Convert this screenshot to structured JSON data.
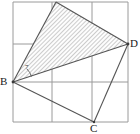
{
  "figure": {
    "canvas": {
      "width": 140,
      "height": 134
    },
    "colors": {
      "grid_line": "#9a9a9a",
      "border_line": "#8a8a8a",
      "figure_line": "#555555",
      "hatch_line": "#9b9b9b",
      "shade_fill": "#fdfdfd",
      "label_text": "#1a1a1a",
      "background": "#ffffff"
    },
    "grid": {
      "x_lines": [
        13,
        52,
        92,
        128
      ],
      "y_lines": [
        2,
        44,
        82,
        122
      ],
      "columns": 3,
      "rows": 3,
      "visible": true
    },
    "points": {
      "B": {
        "label": "B",
        "x": 13,
        "y": 82
      },
      "C": {
        "label": "C",
        "x": 94,
        "y": 122
      },
      "D": {
        "label": "D",
        "x": 128,
        "y": 44
      },
      "A": {
        "label": "",
        "x": 56,
        "y": 2
      }
    },
    "shaded_triangle": {
      "name": "hatched-triangle-BAD",
      "vertices": "13,82 56,2 128,44",
      "fill_pattern": "diagonal-hatch"
    },
    "segments": [
      {
        "name": "segment-B-A",
        "x1": 13,
        "y1": 82,
        "x2": 56,
        "y2": 2
      },
      {
        "name": "segment-A-D",
        "x1": 56,
        "y1": 2,
        "x2": 128,
        "y2": 44
      },
      {
        "name": "segment-D-B",
        "x1": 128,
        "y1": 44,
        "x2": 13,
        "y2": 82
      },
      {
        "name": "segment-B-C",
        "x1": 13,
        "y1": 82,
        "x2": 94,
        "y2": 122
      },
      {
        "name": "segment-C-D",
        "x1": 94,
        "y1": 122,
        "x2": 128,
        "y2": 44
      }
    ],
    "angle_mark": {
      "name": "angle-arc-at-B",
      "label": "7",
      "center_x": 13,
      "center_y": 82,
      "radius": 19,
      "start_x": 27,
      "start_y": 69,
      "end_x": 31,
      "end_y": 76
    }
  }
}
